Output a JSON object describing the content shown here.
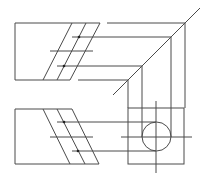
{
  "diagram": {
    "type": "orthographic-projection",
    "stroke_color": "#4a4a4a",
    "dot_color": "#222222",
    "width": 206,
    "height": 183,
    "top_view": {
      "outline": [
        [
          100,
          23
        ],
        [
          15,
          23
        ],
        [
          15,
          80
        ],
        [
          70,
          80
        ]
      ],
      "top_edge_ext": [
        [
          107,
          23
        ],
        [
          185,
          23
        ]
      ],
      "bottom_edge_ext": [
        [
          78,
          80
        ],
        [
          128,
          80
        ]
      ],
      "diagonals": [
        [
          [
            43,
            80
          ],
          [
            72,
            23
          ]
        ],
        [
          [
            57,
            80
          ],
          [
            86,
            23
          ]
        ],
        [
          [
            70,
            80
          ],
          [
            100,
            23
          ]
        ]
      ],
      "horizontals": [
        [
          [
            72,
            37
          ],
          [
            171,
            37
          ]
        ],
        [
          [
            50,
            51
          ],
          [
            93,
            51
          ]
        ],
        [
          [
            57,
            66
          ],
          [
            142,
            66
          ]
        ]
      ],
      "dots": [
        [
          79,
          37
        ],
        [
          64,
          66
        ]
      ]
    },
    "mitre_line": [
      [
        200,
        8
      ],
      [
        113,
        95
      ]
    ],
    "transfer_verticals": [
      [
        [
          185,
          23
        ],
        [
          185,
          108
        ]
      ],
      [
        [
          171,
          37
        ],
        [
          171,
          137
        ]
      ],
      [
        [
          142,
          66
        ],
        [
          142,
          137
        ]
      ],
      [
        [
          128,
          80
        ],
        [
          128,
          108
        ]
      ]
    ],
    "front_view": {
      "outline": [
        [
          72,
          109
        ],
        [
          15,
          109
        ],
        [
          15,
          164
        ],
        [
          99,
          164
        ]
      ],
      "diagonals": [
        [
          [
            43,
            109
          ],
          [
            70,
            164
          ]
        ],
        [
          [
            57,
            109
          ],
          [
            85,
            164
          ]
        ],
        [
          [
            72,
            109
          ],
          [
            99,
            164
          ]
        ]
      ],
      "horizontals": [
        [
          [
            57,
            122
          ],
          [
            156,
            122
          ]
        ],
        [
          [
            50,
            137
          ],
          [
            93,
            137
          ]
        ],
        [
          [
            72,
            151
          ],
          [
            156,
            151
          ]
        ]
      ],
      "dots": [
        [
          64,
          122
        ],
        [
          78,
          151
        ]
      ]
    },
    "side_view": {
      "rect": {
        "x": 128,
        "y": 108,
        "w": 56,
        "h": 56
      },
      "circle": {
        "cx": 156.5,
        "cy": 136.5,
        "r": 14.5
      },
      "center_vertical": [
        [
          156,
          101
        ],
        [
          156,
          173
        ]
      ],
      "center_horizontal": [
        [
          121,
          137
        ],
        [
          192,
          137
        ]
      ]
    }
  }
}
